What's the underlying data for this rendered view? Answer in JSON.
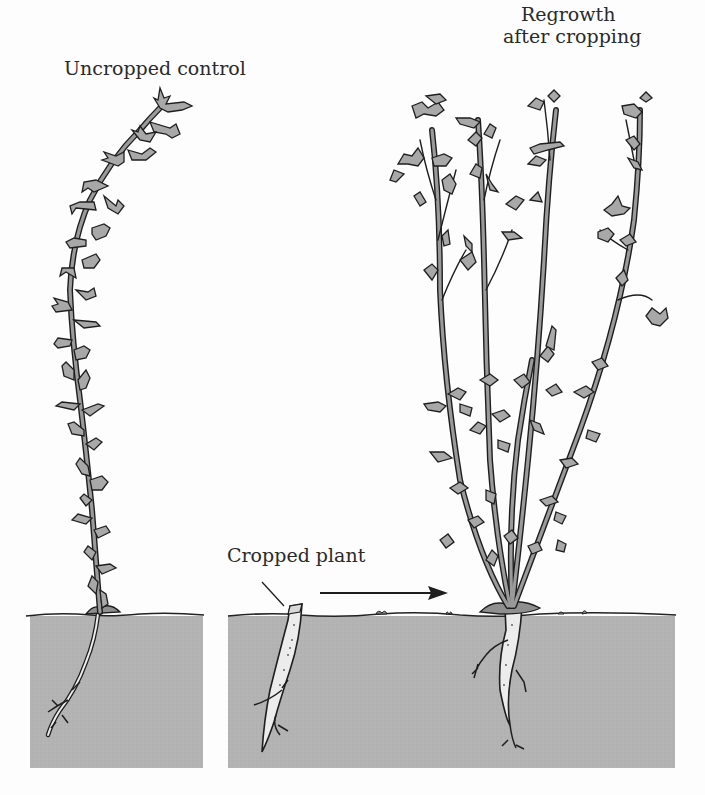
{
  "figure": {
    "type": "botanical illustration",
    "labels": {
      "control": "Uncropped control",
      "regrowth_line1": "Regrowth",
      "regrowth_line2": "after cropping",
      "cropped": "Cropped plant"
    },
    "panels": [
      {
        "id": "control",
        "description": "Single tall unbranched stem with many small lobed leaves and taproot in soil"
      },
      {
        "id": "cropped",
        "description": "Stump of taproot cut at soil surface"
      },
      {
        "id": "regrowth",
        "description": "Multiple branched stems regrowing from root crown"
      }
    ],
    "arrow": {
      "from": "cropped",
      "to": "regrowth"
    },
    "colors": {
      "background": "#fdfdfd",
      "soil": "#b3b3b3",
      "soil_line": "#222222",
      "stem_fill": "#9a9a9a",
      "leaf_fill": "#a8a8a8",
      "outline": "#1e1e1e",
      "root_fill": "#e8e8e8",
      "text": "#2a2a2a"
    }
  }
}
